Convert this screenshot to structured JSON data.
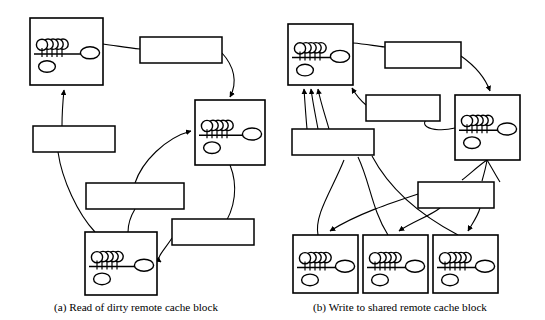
{
  "figure": {
    "type": "diagram",
    "node_glyphs": {
      "processor": "P",
      "memory": "M",
      "directory": "DIR",
      "cache_stack_count": 4
    },
    "captions": [
      {
        "id": "a",
        "text": "(a) Read of dirty remote cache block"
      },
      {
        "id": "b",
        "text": "(b) Write to shared remote cache block"
      }
    ]
  },
  "panel_a": {
    "caption": "(a) Read of dirty remote cache block",
    "nodes": [
      {
        "id": "local",
        "title": "Local",
        "x": 30,
        "y": 18,
        "w": 73,
        "h": 67
      },
      {
        "id": "home",
        "title": "Home",
        "x": 195,
        "y": 100,
        "w": 70,
        "h": 65
      },
      {
        "id": "dirty",
        "title": "Dirty",
        "x": 85,
        "y": 232,
        "w": 72,
        "h": 63
      }
    ],
    "messages": [
      {
        "id": "m1",
        "line1": "1. Read Request",
        "line2": "to Home",
        "x": 140,
        "y": 37,
        "w": 82,
        "h": 26
      },
      {
        "id": "m3a",
        "line1": "3a. Read Reply",
        "line2": "to Local",
        "x": 33,
        "y": 126,
        "w": 82,
        "h": 26
      },
      {
        "id": "m3b",
        "line1": "3b. Sharing Writeback",
        "line2": "to Home",
        "x": 86,
        "y": 183,
        "w": 98,
        "h": 26
      },
      {
        "id": "m2",
        "line1": "2. Forward Read",
        "line2": "Request to Dirty",
        "x": 172,
        "y": 219,
        "w": 82,
        "h": 26
      }
    ]
  },
  "panel_b": {
    "caption": "(b) Write to shared remote cache block",
    "nodes": [
      {
        "id": "local",
        "title": "Local",
        "x": 288,
        "y": 24,
        "w": 65,
        "h": 61
      },
      {
        "id": "home",
        "title": "Home",
        "x": 455,
        "y": 95,
        "w": 65,
        "h": 65
      },
      {
        "id": "shared1",
        "title": "Shared",
        "x": 293,
        "y": 235,
        "w": 65,
        "h": 58
      },
      {
        "id": "shared2",
        "title": "Shared",
        "x": 363,
        "y": 235,
        "w": 65,
        "h": 58
      },
      {
        "id": "shared3",
        "title": "Shared",
        "x": 433,
        "y": 235,
        "w": 65,
        "h": 58
      }
    ],
    "messages": [
      {
        "id": "n1",
        "line1": "1. RdEx Request",
        "line2": "to Home",
        "x": 385,
        "y": 42,
        "w": 76,
        "h": 26
      },
      {
        "id": "n2a",
        "line1": "2a. RdEx Reply",
        "line2": "to Local",
        "x": 366,
        "y": 95,
        "w": 74,
        "h": 26
      },
      {
        "id": "n3",
        "line1": "3. Invalidate Ack's",
        "line2": "to Local",
        "x": 292,
        "y": 129,
        "w": 82,
        "h": 26
      },
      {
        "id": "n2b",
        "line1": "2b. Invalidations",
        "line2": "to Shared",
        "x": 418,
        "y": 182,
        "w": 76,
        "h": 26
      }
    ]
  }
}
